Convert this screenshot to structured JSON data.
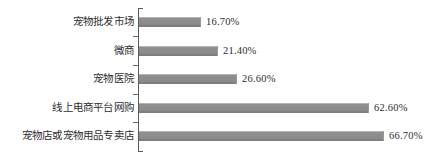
{
  "chart_data": {
    "type": "bar",
    "orientation": "horizontal",
    "title": "",
    "subtitle": "",
    "xlabel": "",
    "ylabel": "",
    "grid": false,
    "legend": "none",
    "axis_line": true,
    "xlim": [
      0,
      75
    ],
    "value_suffix": "%",
    "categories": [
      "宠物批发市场",
      "微商",
      "宠物医院",
      "线上电商平台网购",
      "宠物店或宠物用品专卖店"
    ],
    "values": [
      16.7,
      21.4,
      26.6,
      62.6,
      66.7
    ],
    "value_labels": [
      "16.70%",
      "21.40%",
      "26.60%",
      "62.60%",
      "66.70%"
    ],
    "colors": {
      "bar": "#8a8a8a",
      "bar_edge": "#7e7e7e",
      "axis": "#5a5a5a",
      "text": "#2e2e2e",
      "background": "#ffffff"
    }
  }
}
